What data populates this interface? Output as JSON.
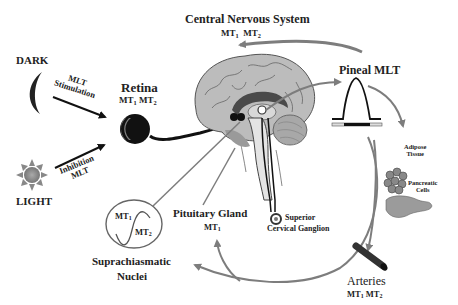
{
  "diagram": {
    "colors": {
      "arrow_gray": "#808080",
      "arrow_black": "#111111",
      "brain_fill": "#b9b9b9",
      "brain_dark": "#555555",
      "light_sun": "#888888",
      "dark_moon": "#222222"
    },
    "nodes": {
      "dark": {
        "label": "DARK",
        "icon": "moon-icon"
      },
      "light": {
        "label": "LIGHT",
        "icon": "sun-icon"
      },
      "mlt_stimulation": {
        "line1": "MLT",
        "line2": "Stimulation"
      },
      "inhibition_mlt": {
        "line1": "Inhibition",
        "line2": "MLT"
      },
      "retina": {
        "label": "Retina",
        "receptors": "MT",
        "r1": "1",
        "r2": "2",
        "icon": "eye-icon"
      },
      "cns": {
        "label": "Central Nervous System",
        "r1": "1",
        "r2": "2"
      },
      "pineal": {
        "label": "Pineal MLT",
        "icon": "melatonin-peak-curve-icon"
      },
      "adipose": {
        "line1": "Adipose",
        "line2": "Tissue",
        "icon": "adipose-cells-icon"
      },
      "pancreatic": {
        "line1": "Pancreatic",
        "line2": "Cells",
        "icon": "pancreas-icon"
      },
      "arteries": {
        "label": "Arteries",
        "r1": "1",
        "r2": "2",
        "icon": "artery-icon"
      },
      "pituitary": {
        "label": "Pituitary Gland",
        "r1": "1"
      },
      "scg": {
        "line1": "Superior",
        "line2": "Cervical Ganglion",
        "icon": "ganglion-icon"
      },
      "scn": {
        "line1": "Suprachiasmatic",
        "line2": "Nuclei",
        "r1": "1",
        "r2": "2",
        "icon": "circadian-wave-icon"
      }
    },
    "mt_prefix": "MT"
  }
}
